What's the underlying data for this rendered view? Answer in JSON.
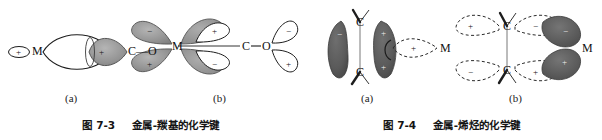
{
  "document": {
    "kind": "textbook-figure-pair",
    "background_color": "#ffffff",
    "ink_color": "#181818",
    "shaded_lobe_color": "#8d8d8d",
    "white_lobe_color": "#ffffff"
  },
  "figures": [
    {
      "id": "fig-7-3",
      "caption_prefix": "图",
      "caption_number": "7-3",
      "caption_title": "金属-羰基的化学键",
      "caption_full": "图 7-3  金属-羰基的化学键",
      "subfigures": [
        {
          "label": "(a)",
          "description": "sigma donation overlap",
          "atoms": [
            "M",
            "C—O"
          ],
          "lobes": [
            {
              "name": "metal-small-lobe",
              "sign": "+",
              "fill": "white"
            },
            {
              "name": "big-open-lobe",
              "sign": "",
              "fill": "white"
            },
            {
              "name": "carbon-shaded-lobe",
              "sign": "+",
              "fill": "shaded"
            }
          ]
        },
        {
          "label": "(b)",
          "description": "pi back-donation overlap",
          "atoms": [
            "M",
            "C",
            "O"
          ],
          "lobes": [
            {
              "name": "metal-upper-left",
              "sign": "−",
              "fill": "shaded"
            },
            {
              "name": "metal-lower-left",
              "sign": "+",
              "fill": "shaded"
            },
            {
              "name": "metal-upper-right",
              "sign": "+",
              "fill": "shaded-outline"
            },
            {
              "name": "metal-lower-right",
              "sign": "−",
              "fill": "shaded-outline"
            },
            {
              "name": "oxygen-upper-right",
              "sign": "−",
              "fill": "white"
            },
            {
              "name": "oxygen-lower-right",
              "sign": "+",
              "fill": "white"
            }
          ]
        }
      ]
    },
    {
      "id": "fig-7-4",
      "caption_prefix": "图",
      "caption_number": "7-4",
      "caption_title": "金属-烯烃的化学键",
      "caption_full": "图 7-4  金属-烯烃的化学键",
      "subfigures": [
        {
          "label": "(a)",
          "description": "alkene pi donation to metal",
          "atoms": [
            "C",
            "C",
            "M"
          ],
          "lobes": [
            {
              "name": "alkene-left-lobe",
              "sign": "−",
              "fill": "dark"
            },
            {
              "name": "alkene-right-lobe-top",
              "sign": "+",
              "fill": "dark"
            },
            {
              "name": "alkene-right-lobe-bottom",
              "sign": "+",
              "fill": "dark"
            },
            {
              "name": "metal-dashed-lobe",
              "sign": "+",
              "fill": "dashed"
            }
          ]
        },
        {
          "label": "(b)",
          "description": "metal d to alkene pi-star back-donation",
          "atoms": [
            "C",
            "C",
            "M"
          ],
          "lobes": [
            {
              "name": "alkene-upper-left",
              "sign": "+",
              "fill": "dashed"
            },
            {
              "name": "alkene-lower-left",
              "sign": "−",
              "fill": "dashed"
            },
            {
              "name": "alkene-upper-right",
              "sign": "−",
              "fill": "dashed"
            },
            {
              "name": "alkene-lower-right",
              "sign": "+",
              "fill": "dashed"
            },
            {
              "name": "metal-upper-lobe",
              "sign": "−",
              "fill": "dark"
            },
            {
              "name": "metal-lower-lobe",
              "sign": "+",
              "fill": "dark"
            }
          ]
        }
      ]
    }
  ],
  "atom_labels": {
    "metal": "M",
    "carbon": "C",
    "oxygen": "O",
    "carbonyl": "C—O"
  },
  "signs": {
    "plus": "+",
    "minus": "−"
  },
  "sub_labels": {
    "a": "(a)",
    "b": "(b)"
  }
}
